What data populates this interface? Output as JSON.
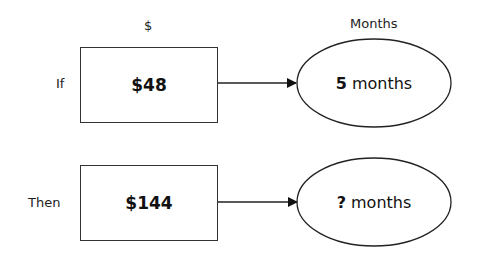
{
  "headers": {
    "dollars": "$",
    "months": "Months"
  },
  "rows": [
    {
      "label": "If",
      "amount": "$48",
      "months_value": "5",
      "months_unit": "months"
    },
    {
      "label": "Then",
      "amount": "$144",
      "months_value": "?",
      "months_unit": "months"
    }
  ]
}
